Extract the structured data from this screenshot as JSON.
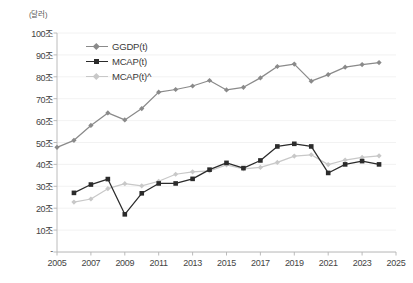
{
  "chart_data": {
    "type": "line",
    "title": "",
    "subtitle": "",
    "xlabel": "",
    "ylabel": "",
    "unit_label": "(달러)",
    "grid": true,
    "legend_position": "top-left-inside",
    "xlim": [
      2005,
      2025
    ],
    "ylim": [
      0,
      100
    ],
    "xticks": [
      "2005",
      "2007",
      "2009",
      "2011",
      "2013",
      "2015",
      "2017",
      "2019",
      "2021",
      "2023",
      "2025"
    ],
    "xtick_values": [
      2005,
      2007,
      2009,
      2011,
      2013,
      2015,
      2017,
      2019,
      2021,
      2023,
      2025
    ],
    "yticks": [
      "-",
      "10조",
      "20조",
      "30조",
      "40조",
      "50조",
      "60조",
      "70조",
      "80조",
      "90조",
      "100조"
    ],
    "ytick_values": [
      0,
      10,
      20,
      30,
      40,
      50,
      60,
      70,
      80,
      90,
      100
    ],
    "series": [
      {
        "name": "GGDP(t)",
        "color": "#8a8a8a",
        "marker": "diamond",
        "x": [
          2005,
          2006,
          2007,
          2008,
          2009,
          2010,
          2011,
          2012,
          2013,
          2014,
          2015,
          2016,
          2017,
          2018,
          2019,
          2020,
          2021,
          2022,
          2023,
          2024
        ],
        "values": [
          47.8,
          51.0,
          57.8,
          63.5,
          60.3,
          65.5,
          73.0,
          74.2,
          75.8,
          78.3,
          74.0,
          75.2,
          79.5,
          84.7,
          85.8,
          78.0,
          81.0,
          84.4,
          85.6,
          86.5
        ]
      },
      {
        "name": "MCAP(t)",
        "color": "#2b2b2b",
        "marker": "square",
        "x": [
          2006,
          2007,
          2008,
          2009,
          2010,
          2011,
          2012,
          2013,
          2014,
          2015,
          2016,
          2017,
          2018,
          2019,
          2020,
          2021,
          2022,
          2023,
          2024
        ],
        "values": [
          27.0,
          30.8,
          33.3,
          17.2,
          26.8,
          31.3,
          31.3,
          33.4,
          37.6,
          40.7,
          38.3,
          41.8,
          48.2,
          49.4,
          48.2,
          36.1,
          40.0,
          41.5,
          40.0
        ]
      },
      {
        "name": "MCAP(t)^",
        "color": "#c8c8c8",
        "marker": "diamond",
        "x": [
          2006,
          2007,
          2008,
          2009,
          2010,
          2011,
          2012,
          2013,
          2014,
          2015,
          2016,
          2017,
          2018,
          2019,
          2020,
          2021,
          2022,
          2023,
          2024
        ],
        "values": [
          22.8,
          24.2,
          28.9,
          31.2,
          30.2,
          32.3,
          35.5,
          36.6,
          37.0,
          39.8,
          38.0,
          38.6,
          40.9,
          43.8,
          44.4,
          39.9,
          42.0,
          43.2,
          43.9
        ]
      }
    ]
  }
}
